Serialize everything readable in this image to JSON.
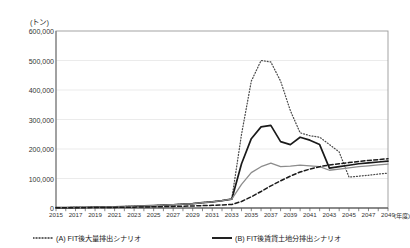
{
  "axis": {
    "y_unit_label": "(トン)",
    "y_ticks": [
      "600,000",
      "500,000",
      "400,000",
      "300,000",
      "200,000",
      "100,000",
      "0"
    ],
    "x_unit_label": "(年度)",
    "x_ticks": [
      "2015",
      "2017",
      "2019",
      "2021",
      "2023",
      "2025",
      "2027",
      "2029",
      "2031",
      "2033",
      "2035",
      "2037",
      "2039",
      "2041",
      "2043",
      "2045",
      "2047",
      "2049"
    ]
  },
  "legend": {
    "items": [
      {
        "key": "a",
        "label": "(A) FIT後大量排出シナリオ",
        "style": "dotted",
        "color": "#333333"
      },
      {
        "key": "b",
        "label": "(B) FIT後賃貸土地分排出シナリオ",
        "style": "solid",
        "color": "#222222"
      }
    ]
  },
  "chart_data": {
    "type": "line",
    "title": "",
    "xlabel": "(年度)",
    "ylabel": "(トン)",
    "ylim": [
      0,
      600000
    ],
    "ytick_values": [
      0,
      100000,
      200000,
      300000,
      400000,
      500000,
      600000
    ],
    "grid": "horizontal",
    "legend_position": "bottom",
    "x": [
      2015,
      2016,
      2017,
      2018,
      2019,
      2020,
      2021,
      2022,
      2023,
      2024,
      2025,
      2026,
      2027,
      2028,
      2029,
      2030,
      2031,
      2032,
      2033,
      2034,
      2035,
      2036,
      2037,
      2038,
      2039,
      2040,
      2041,
      2042,
      2043,
      2044,
      2045,
      2046,
      2047,
      2048,
      2049
    ],
    "series": [
      {
        "name": "(A) FIT後大量排出シナリオ",
        "style": "dotted",
        "color": "#4a4a4a",
        "values": [
          1000,
          1500,
          2000,
          2500,
          3000,
          3500,
          4000,
          5000,
          6000,
          7000,
          8000,
          9500,
          11000,
          13000,
          15000,
          18000,
          21000,
          25000,
          30000,
          250000,
          430000,
          500000,
          495000,
          430000,
          330000,
          255000,
          245000,
          240000,
          215000,
          190000,
          105000,
          108000,
          111000,
          115000,
          118000
        ]
      },
      {
        "name": "(B) FIT後賃貸土地分排出シナリオ",
        "style": "solid",
        "color": "#1a1a1a",
        "values": [
          1000,
          1500,
          2000,
          2500,
          3000,
          3500,
          4000,
          5000,
          6000,
          7000,
          8000,
          9500,
          11000,
          13000,
          15000,
          18000,
          21000,
          25000,
          30000,
          150000,
          235000,
          275000,
          280000,
          225000,
          215000,
          240000,
          230000,
          215000,
          135000,
          140000,
          145000,
          150000,
          153000,
          156000,
          159000
        ]
      },
      {
        "name": "series-gray",
        "style": "solid-gray",
        "color": "#8c8c8c",
        "values": [
          1000,
          1500,
          2000,
          2500,
          3000,
          3500,
          4000,
          5000,
          6000,
          7000,
          8000,
          9500,
          11000,
          13000,
          15000,
          18000,
          21000,
          25000,
          30000,
          80000,
          120000,
          140000,
          152000,
          140000,
          142000,
          145000,
          143000,
          140000,
          128000,
          132000,
          136000,
          140000,
          143000,
          146000,
          149000
        ]
      },
      {
        "name": "series-dashed",
        "style": "dashed",
        "color": "#1a1a1a",
        "values": [
          500,
          700,
          900,
          1100,
          1400,
          1700,
          2000,
          2400,
          2900,
          3400,
          4000,
          4700,
          5400,
          6200,
          7000,
          8000,
          9000,
          10500,
          12000,
          22000,
          38000,
          56000,
          75000,
          92000,
          108000,
          122000,
          132000,
          140000,
          146000,
          150000,
          154000,
          158000,
          161000,
          164000,
          167000
        ]
      }
    ]
  }
}
